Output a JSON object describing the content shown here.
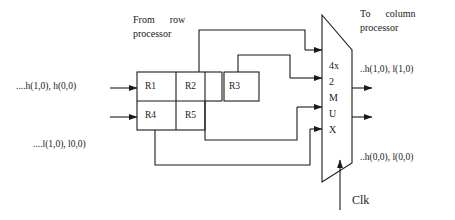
{
  "diagram": {
    "title_left": "From      row",
    "title_left_line2": "processor",
    "title_right": "To      column",
    "title_right_line2": "processor",
    "input_high": "....h(1,0), h(0,0)",
    "input_low": "....l(1,0), l0,0)",
    "output_high": "..h(1,0), l(1,0)",
    "output_low": "..h(0,0), l(0,0)",
    "clock_label": "Clk",
    "registers": [
      {
        "name": "R1"
      },
      {
        "name": "R2"
      },
      {
        "name": "R3"
      },
      {
        "name": "R4"
      },
      {
        "name": "R5"
      }
    ],
    "mux": {
      "lines": [
        "4x",
        "2",
        "M",
        "U",
        "X"
      ],
      "line0": "4x",
      "line1": "2",
      "line2": "M",
      "line3": "U",
      "line4": "X"
    },
    "colors": {
      "stroke": "#1a1a1a",
      "text": "#1a1a1a",
      "background": "#ffffff"
    }
  }
}
